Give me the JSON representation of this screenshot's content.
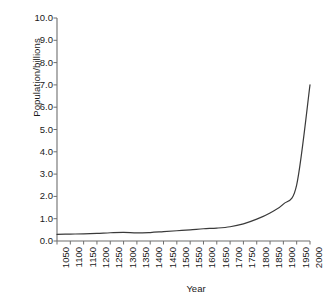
{
  "chart_data": {
    "type": "line",
    "title": "",
    "xlabel": "Year",
    "ylabel": "Population/billions",
    "xlim": [
      1050,
      2000
    ],
    "ylim": [
      0.0,
      10.0
    ],
    "grid": false,
    "legend": null,
    "line_color": "#3a3a3a",
    "background_color": "#ffffff",
    "axis_color": "#6e6e6e",
    "text_color": "#1a1a1a",
    "x_ticks": [
      "1050",
      "1100",
      "1150",
      "1200",
      "1250",
      "1300",
      "1350",
      "1400",
      "1450",
      "1500",
      "1550",
      "1600",
      "1650",
      "1700",
      "1750",
      "1800",
      "1850",
      "1900",
      "1950",
      "2000"
    ],
    "y_ticks": [
      "10.0",
      "9.0",
      "8.0",
      "7.0",
      "6.0",
      "5.0",
      "4.0",
      "3.0",
      "2.0",
      "1.0",
      "0.0"
    ],
    "series": [
      {
        "name": "World population",
        "x": [
          1050,
          1100,
          1150,
          1200,
          1250,
          1300,
          1350,
          1400,
          1450,
          1500,
          1550,
          1600,
          1650,
          1700,
          1750,
          1800,
          1850,
          1900,
          1950,
          2000
        ],
        "values": [
          0.3,
          0.31,
          0.32,
          0.34,
          0.37,
          0.39,
          0.36,
          0.38,
          0.42,
          0.46,
          0.5,
          0.55,
          0.58,
          0.64,
          0.77,
          0.98,
          1.26,
          1.65,
          2.52,
          7.0
        ]
      }
    ]
  }
}
